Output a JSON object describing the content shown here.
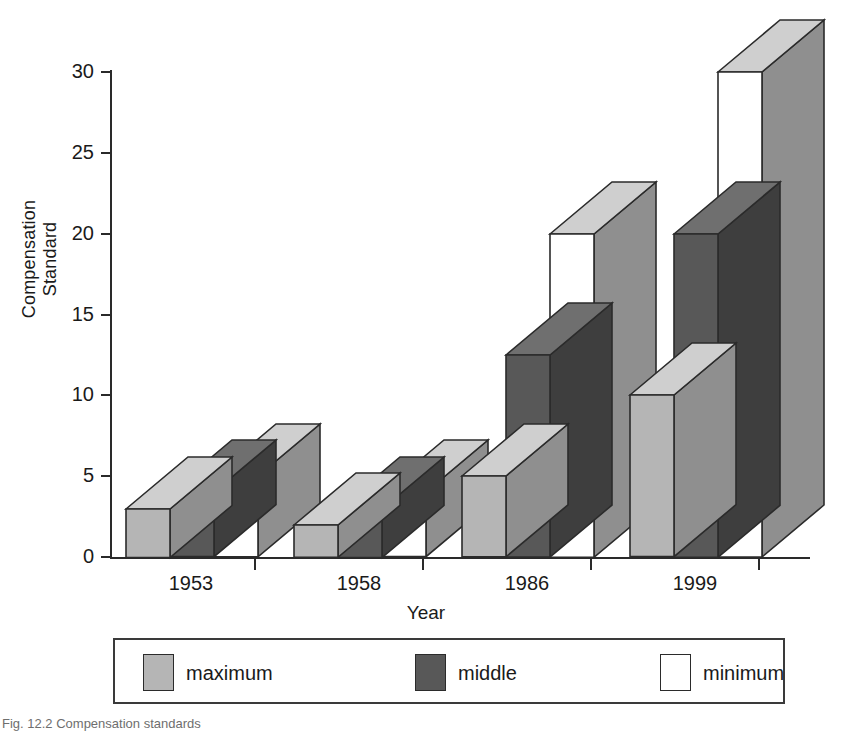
{
  "chart_data": {
    "type": "bar",
    "style": "3d-grouped-bar",
    "title": "",
    "xlabel": "Year",
    "ylabel": "Compensation Standard",
    "categories": [
      "1953",
      "1958",
      "1986",
      "1999"
    ],
    "series": [
      {
        "name": "maximum",
        "color": "#b5b5b5",
        "values": [
          3,
          2,
          5,
          10
        ]
      },
      {
        "name": "middle",
        "color": "#585858",
        "values": [
          4,
          3,
          12.5,
          20
        ]
      },
      {
        "name": "minimum",
        "color": "#ffffff",
        "values": [
          5,
          4,
          20,
          30
        ]
      }
    ],
    "ylim": [
      0,
      30
    ],
    "yticks": [
      "0",
      "5",
      "10",
      "15",
      "20",
      "25",
      "30"
    ],
    "grid": false,
    "legend_position": "bottom",
    "legend_entries": [
      "maximum",
      "middle",
      "minimum"
    ]
  },
  "axes": {
    "y_label_line1": "Compensation",
    "y_label_line2": "Standard",
    "x_label": "Year"
  },
  "colors": {
    "maximum_face": "#b5b5b5",
    "maximum_top": "#cfcfcf",
    "maximum_side": "#8f8f8f",
    "middle_face": "#585858",
    "middle_top": "#6f6f6f",
    "middle_side": "#3e3e3e",
    "minimum_face": "#ffffff",
    "minimum_top": "#cfcfcf",
    "minimum_side": "#8f8f8f",
    "axis": "#2a2a2a",
    "outline": "#2b2b2b"
  },
  "caption": {
    "text": "Fig. 12.2  Compensation standards"
  }
}
